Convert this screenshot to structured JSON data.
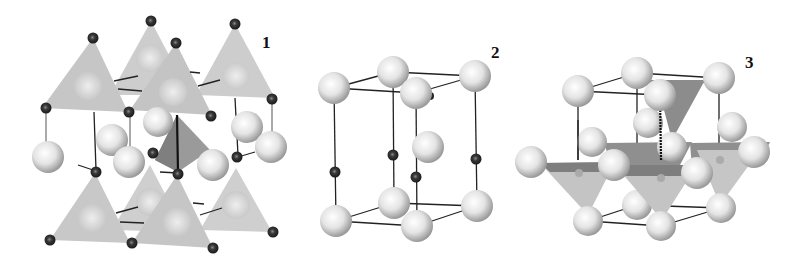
{
  "figure": {
    "panels": [
      {
        "id": "1",
        "label": "1",
        "label_pos": [
          268,
          48
        ]
      },
      {
        "id": "2",
        "label": "2",
        "label_pos": [
          494,
          57
        ]
      },
      {
        "id": "3",
        "label": "3",
        "label_pos": [
          749,
          66
        ]
      }
    ],
    "colors": {
      "background": "#ffffff",
      "polyhedron_light": "#c9c9c9",
      "polyhedron_dark": "#8e8e8e",
      "large_atom": "#e6e6e6",
      "small_atom": "#2e2e2e",
      "bond": "#222222"
    },
    "legend": {
      "large_atom": "large-sphere",
      "small_atom": "small-dark-sphere",
      "polyhedron": "tetrahedron"
    }
  }
}
